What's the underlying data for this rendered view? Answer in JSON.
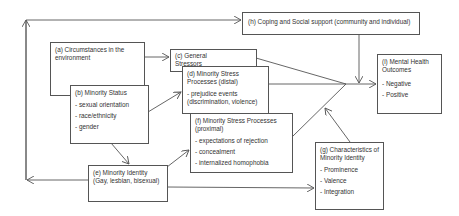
{
  "diagram": {
    "boxes": {
      "a": {
        "title": "(a)  Circumstances in the environment",
        "items": []
      },
      "b": {
        "title": "(b)  Minority Status",
        "items": [
          "- sexual orientation",
          "- race/ethnicity",
          "- gender"
        ]
      },
      "c": {
        "title": "(c)  General Stressors",
        "items": []
      },
      "d": {
        "title": "(d) Minority Stress Processes (distal)",
        "items": [
          "- prejudice events (discrimination, violence)"
        ]
      },
      "e": {
        "title": "(e) Minority Identity (Gay, lesbian, bisexual)",
        "items": []
      },
      "f": {
        "title": "(f) Minority Stress Processes (proximal)",
        "items": [
          "- expectations of  rejection",
          "- concealment",
          "- internalized  homophobia"
        ]
      },
      "g": {
        "title": "(g) Characteristics of Minority Identity",
        "items": [
          "- Prominence",
          "- Valence",
          "- Integration"
        ]
      },
      "h": {
        "title": "(h) Coping  and Social support (community and individual)",
        "items": []
      },
      "i": {
        "title": "(i) Mental Health Outcomes",
        "items": [
          "- Negative",
          "- Positive"
        ]
      }
    },
    "edges": [
      {
        "from": "a",
        "to": "c"
      },
      {
        "from": "b",
        "to": "d"
      },
      {
        "from": "b",
        "to": "e"
      },
      {
        "from": "e",
        "to": "f"
      },
      {
        "from": "e",
        "to": "g"
      },
      {
        "from": "e",
        "to": "h",
        "via": "left-loop"
      },
      {
        "from": "c",
        "to": "i"
      },
      {
        "from": "d",
        "to": "i"
      },
      {
        "from": "f",
        "to": "i"
      },
      {
        "from": "h",
        "to": "i"
      },
      {
        "from": "g",
        "to": "f-i-path"
      }
    ],
    "colors": {
      "line": "#555555",
      "text": "#333333",
      "background": "#ffffff"
    }
  }
}
